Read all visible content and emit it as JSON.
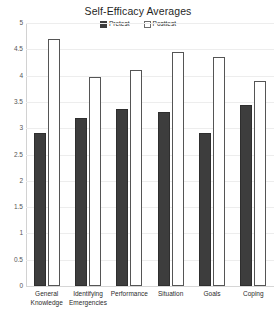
{
  "chart_data": {
    "type": "bar",
    "title": "Self-Efficacy Averages",
    "xlabel": "",
    "ylabel": "",
    "ylim": [
      0,
      5
    ],
    "yticks": [
      "0",
      "0.5",
      "1",
      "1.5",
      "2",
      "2.5",
      "3",
      "3.5",
      "4",
      "4.5",
      "5"
    ],
    "ytick_values": [
      0,
      0.5,
      1,
      1.5,
      2,
      2.5,
      3,
      3.5,
      4,
      4.5,
      5
    ],
    "grid": true,
    "legend_position": "top-center",
    "categories": [
      "General Knowledge",
      "Identifying Emergencies",
      "Performance",
      "Situation",
      "Goals",
      "Coping"
    ],
    "series": [
      {
        "name": "Pretest",
        "style": "filled",
        "color": "#3d3d3d",
        "values": [
          2.9,
          3.2,
          3.37,
          3.3,
          2.9,
          3.45
        ]
      },
      {
        "name": "Posttest",
        "style": "hollow",
        "color": "#ffffff",
        "border_color": "#555555",
        "values": [
          4.7,
          3.97,
          4.1,
          4.45,
          4.35,
          3.9
        ]
      }
    ]
  },
  "legend": {
    "items": [
      {
        "label": "Pretest",
        "swatch": "filled-square-icon"
      },
      {
        "label": "Posttest",
        "swatch": "hollow-square-icon"
      }
    ]
  }
}
